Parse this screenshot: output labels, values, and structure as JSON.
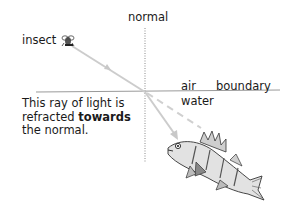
{
  "diagram": {
    "labels": {
      "normal": "normal",
      "insect": "insect",
      "air": "air",
      "boundary": "boundary",
      "water": "water"
    },
    "caption": {
      "line1": "This ray of light is",
      "line2_prefix": "refracted ",
      "line2_bold": "towards",
      "line3": "the normal."
    },
    "icons": {
      "insect": "insect-icon",
      "fish": "fish-icon"
    },
    "colors": {
      "text": "#1a1a1a",
      "ray": "#c8c8c8",
      "boundary": "#9a9a9a",
      "normal_line": "#8a8a8a",
      "dashed": "#cfcfcf"
    }
  }
}
